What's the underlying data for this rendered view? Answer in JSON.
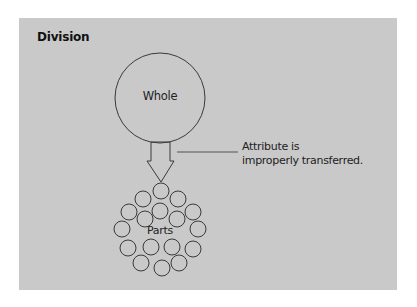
{
  "title": "Division",
  "whole": {
    "label": "Whole",
    "cx": 160,
    "cy": 98,
    "r": 45
  },
  "arrow": {
    "shaft_left": 151,
    "shaft_right": 170,
    "shaft_top": 142,
    "shaft_bottom": 161,
    "head_left": 147,
    "head_right": 174,
    "tip_x": 161,
    "tip_y": 182
  },
  "annotation": {
    "line1": "Attribute is",
    "line2": "improperly transferred.",
    "connector": {
      "x1": 177,
      "y1": 152,
      "x2": 238,
      "y2": 152
    }
  },
  "parts": {
    "label": "Parts",
    "r": 8,
    "circles": [
      {
        "cx": 161,
        "cy": 191
      },
      {
        "cx": 143,
        "cy": 199
      },
      {
        "cx": 178,
        "cy": 199
      },
      {
        "cx": 129,
        "cy": 212
      },
      {
        "cx": 160,
        "cy": 211
      },
      {
        "cx": 193,
        "cy": 212
      },
      {
        "cx": 145,
        "cy": 219
      },
      {
        "cx": 177,
        "cy": 219
      },
      {
        "cx": 122,
        "cy": 229
      },
      {
        "cx": 198,
        "cy": 229
      },
      {
        "cx": 128,
        "cy": 248
      },
      {
        "cx": 151,
        "cy": 247
      },
      {
        "cx": 172,
        "cy": 247
      },
      {
        "cx": 193,
        "cy": 249
      },
      {
        "cx": 141,
        "cy": 263
      },
      {
        "cx": 179,
        "cy": 263
      },
      {
        "cx": 162,
        "cy": 268
      }
    ]
  },
  "colors": {
    "panel": "#c9c9c9",
    "stroke": "#3a3a3a",
    "text": "#222222"
  }
}
